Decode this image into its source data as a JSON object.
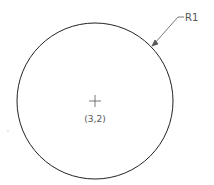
{
  "diagram": {
    "type": "cad-circle",
    "circle": {
      "cx": 95,
      "cy": 101,
      "r": 78,
      "stroke": "#222222"
    },
    "center_marker": {
      "x": 95,
      "y": 101,
      "size": 6
    },
    "center_label": "(3,2)",
    "radius_label": "R1",
    "leader": {
      "x1": 153,
      "y1": 45,
      "x2": 178,
      "y2": 17,
      "x3": 186,
      "y3": 17
    }
  }
}
